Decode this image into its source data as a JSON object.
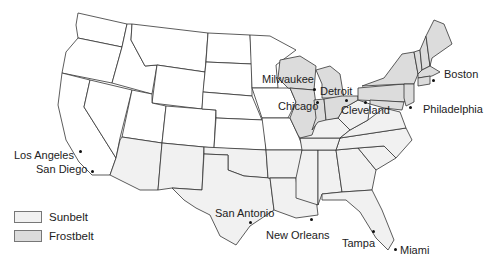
{
  "map": {
    "title": "",
    "colors": {
      "sunbelt": "#f1f1f1",
      "frostbelt": "#dcdcdc",
      "other": "#ffffff",
      "border": "#333333"
    }
  },
  "legend": {
    "items": [
      {
        "label": "Sunbelt",
        "color": "#f1f1f1"
      },
      {
        "label": "Frostbelt",
        "color": "#dcdcdc"
      }
    ]
  },
  "cities": [
    {
      "name": "Los Angeles"
    },
    {
      "name": "San Diego"
    },
    {
      "name": "Milwaukee"
    },
    {
      "name": "Detroit"
    },
    {
      "name": "Chicago"
    },
    {
      "name": "Cleveland"
    },
    {
      "name": "Boston"
    },
    {
      "name": "Philadelphia"
    },
    {
      "name": "San Antonio"
    },
    {
      "name": "New Orleans"
    },
    {
      "name": "Tampa"
    },
    {
      "name": "Miami"
    }
  ]
}
